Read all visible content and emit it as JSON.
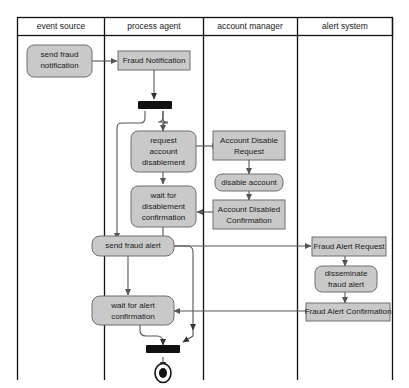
{
  "diagram": {
    "type": "uml-activity-diagram",
    "colors": {
      "node_fill": "#c9c9c9",
      "node_stroke": "#6f6f6f",
      "frame_stroke": "#111111",
      "edge_stroke": "#555555",
      "bar_fill": "#111111",
      "background": "#ffffff",
      "text": "#1a1a1a"
    },
    "lanes": [
      {
        "id": "event-source",
        "label": "event source"
      },
      {
        "id": "process-agent",
        "label": "process agent"
      },
      {
        "id": "account-manager",
        "label": "account manager"
      },
      {
        "id": "alert-system",
        "label": "alert system"
      }
    ],
    "nodes": [
      {
        "id": "send-fraud-notification",
        "lane": "event-source",
        "shape": "rounded",
        "lines": [
          "send fraud",
          "notification"
        ]
      },
      {
        "id": "fraud-notification",
        "lane": "process-agent",
        "shape": "rect",
        "lines": [
          "Fraud Notification"
        ]
      },
      {
        "id": "fork-bar",
        "lane": "process-agent",
        "shape": "bar",
        "lines": []
      },
      {
        "id": "request-account-disablement",
        "lane": "process-agent",
        "shape": "rounded",
        "lines": [
          "request",
          "account",
          "disablement"
        ]
      },
      {
        "id": "wait-for-disablement-confirmation",
        "lane": "process-agent",
        "shape": "rounded",
        "lines": [
          "wait for",
          "disablement",
          "confirmation"
        ]
      },
      {
        "id": "account-disable-request",
        "lane": "account-manager",
        "shape": "rect",
        "lines": [
          "Account Disable",
          "Request"
        ]
      },
      {
        "id": "disable-account",
        "lane": "account-manager",
        "shape": "rounded",
        "lines": [
          "disable account"
        ]
      },
      {
        "id": "account-disabled-confirmation",
        "lane": "account-manager",
        "shape": "rect",
        "lines": [
          "Account Disabled",
          "Confirmation"
        ]
      },
      {
        "id": "send-fraud-alert",
        "lane": "process-agent",
        "shape": "rounded",
        "lines": [
          "send fraud alert"
        ]
      },
      {
        "id": "fraud-alert-request",
        "lane": "alert-system",
        "shape": "rect",
        "lines": [
          "Fraud Alert Request"
        ]
      },
      {
        "id": "disseminate-fraud-alert",
        "lane": "alert-system",
        "shape": "rounded",
        "lines": [
          "disseminate",
          "fraud alert"
        ]
      },
      {
        "id": "fraud-alert-confirmation",
        "lane": "alert-system",
        "shape": "rect",
        "lines": [
          "Fraud Alert Confirmation"
        ]
      },
      {
        "id": "wait-for-alert-confirmation",
        "lane": "process-agent",
        "shape": "rounded",
        "lines": [
          "wait for alert",
          "confirmation"
        ]
      },
      {
        "id": "join-bar",
        "lane": "process-agent",
        "shape": "bar",
        "lines": []
      },
      {
        "id": "final-node",
        "lane": "process-agent",
        "shape": "final",
        "lines": []
      }
    ],
    "labels": {
      "lane_event_source": "event source",
      "lane_process_agent": "process agent",
      "lane_account_manager": "account manager",
      "lane_alert_system": "alert system",
      "send_fraud_notification_l1": "send fraud",
      "send_fraud_notification_l2": "notification",
      "fraud_notification": "Fraud Notification",
      "request_account_disablement_l1": "request",
      "request_account_disablement_l2": "account",
      "request_account_disablement_l3": "disablement",
      "wait_for_disablement_confirmation_l1": "wait for",
      "wait_for_disablement_confirmation_l2": "disablement",
      "wait_for_disablement_confirmation_l3": "confirmation",
      "account_disable_request_l1": "Account Disable",
      "account_disable_request_l2": "Request",
      "disable_account": "disable account",
      "account_disabled_confirmation_l1": "Account Disabled",
      "account_disabled_confirmation_l2": "Confirmation",
      "send_fraud_alert": "send fraud alert",
      "fraud_alert_request": "Fraud Alert Request",
      "disseminate_fraud_alert_l1": "disseminate",
      "disseminate_fraud_alert_l2": "fraud alert",
      "fraud_alert_confirmation": "Fraud Alert Confirmation",
      "wait_for_alert_confirmation_l1": "wait for alert",
      "wait_for_alert_confirmation_l2": "confirmation"
    }
  }
}
